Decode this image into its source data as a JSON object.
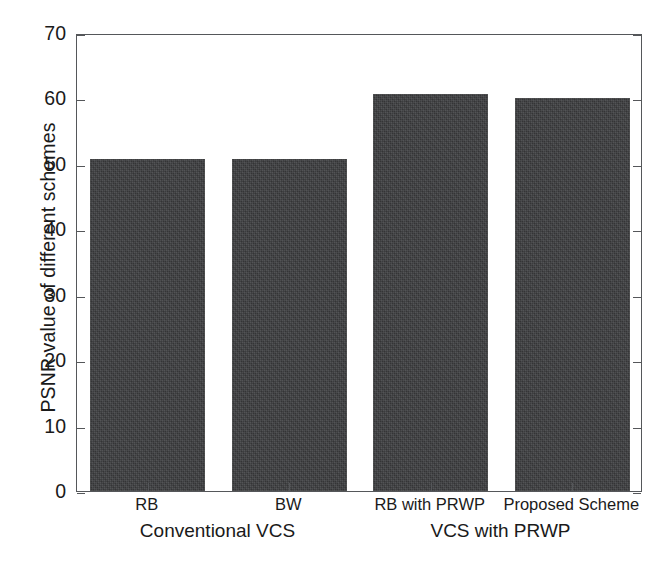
{
  "chart_data": {
    "type": "bar",
    "title": "",
    "xlabel": "",
    "ylabel": "PSNR value of different schemes",
    "categories": [
      "RB",
      "BW",
      "RB with PRWP",
      "Proposed Scheme"
    ],
    "values": [
      50.8,
      50.8,
      60.7,
      60.0
    ],
    "ylim": [
      0,
      70
    ],
    "ytick_labels": [
      "0",
      "10",
      "20",
      "30",
      "40",
      "50",
      "60",
      "70"
    ],
    "ytick_values": [
      0,
      10,
      20,
      30,
      40,
      50,
      60,
      70
    ],
    "grid": false,
    "legend": "none",
    "bar_color": "#3b3c3e",
    "axis_color": "#55575a",
    "background_color": "#ffffff",
    "groups": [
      {
        "label": "Conventional VCS",
        "members": [
          "RB",
          "BW"
        ]
      },
      {
        "label": "VCS with PRWP",
        "members": [
          "RB with PRWP",
          "Proposed Scheme"
        ]
      }
    ]
  }
}
